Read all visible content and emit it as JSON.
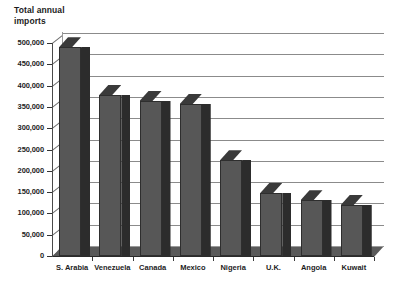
{
  "chart_data": {
    "type": "bar",
    "title": "Total annual\nimports",
    "xlabel": "",
    "ylabel": "Total annual imports",
    "categories": [
      "S. Arabia",
      "Venezuela",
      "Canada",
      "Mexico",
      "Nigeria",
      "U.K.",
      "Angola",
      "Kuwait"
    ],
    "values": [
      490000,
      378000,
      364000,
      357000,
      225000,
      148000,
      131000,
      120000
    ],
    "ylim": [
      0,
      500000
    ],
    "ytick_values": [
      0,
      50000,
      100000,
      150000,
      200000,
      250000,
      300000,
      350000,
      400000,
      450000,
      500000
    ],
    "ytick_labels": [
      "0",
      "50,000",
      "100,000",
      "150,000",
      "200,000",
      "250,000",
      "300,000",
      "350,000",
      "400,000",
      "450,000",
      "500,000"
    ],
    "grid": true,
    "legend": false,
    "style": "3d-column",
    "colors": {
      "bar_front": "#575757",
      "bar_side": "#2c2c2c",
      "bar_top": "#3a3a3a",
      "floor": "#5a5a5a",
      "gridline": "#8b8b8b",
      "text": "#1d1d1d",
      "background": "#ffffff"
    }
  }
}
